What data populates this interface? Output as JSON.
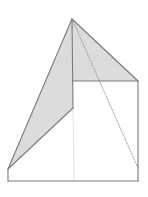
{
  "diagram": {
    "type": "geometric-solid",
    "colors": {
      "background": "#ffffff",
      "edge": "#7a7a7a",
      "shade": "#dcdcdc",
      "hidden": "#9a9a9a",
      "faint": "#e2e2e2"
    },
    "vertices": {
      "apex": [
        72,
        19
      ],
      "mid_top": [
        73,
        81
      ],
      "right_top": [
        138,
        81
      ],
      "mid_low": [
        73,
        108
      ],
      "left_low": [
        8,
        169
      ],
      "left_bottom": [
        8,
        181
      ],
      "right_bottom": [
        138,
        181
      ],
      "mid_bottom": [
        74,
        181
      ],
      "right_dash_end": [
        138,
        168
      ]
    },
    "shaded_faces": [
      {
        "name": "left-face",
        "points": [
          [
            72,
            19
          ],
          [
            73,
            108
          ],
          [
            8,
            169
          ]
        ]
      },
      {
        "name": "right-face",
        "points": [
          [
            72,
            19
          ],
          [
            138,
            81
          ],
          [
            73,
            81
          ]
        ]
      }
    ],
    "solid_edges": [
      [
        [
          72,
          19
        ],
        [
          8,
          169
        ]
      ],
      [
        [
          72,
          19
        ],
        [
          138,
          81
        ]
      ],
      [
        [
          72,
          19
        ],
        [
          73,
          108
        ]
      ],
      [
        [
          73,
          81
        ],
        [
          138,
          81
        ]
      ],
      [
        [
          73,
          108
        ],
        [
          8,
          169
        ]
      ],
      [
        [
          138,
          81
        ],
        [
          138,
          181
        ]
      ],
      [
        [
          8,
          169
        ],
        [
          8,
          181
        ]
      ],
      [
        [
          8,
          181
        ],
        [
          138,
          181
        ]
      ]
    ],
    "dashed_edges": [
      [
        [
          72,
          19
        ],
        [
          138,
          168
        ]
      ]
    ],
    "faint_edges": [
      [
        [
          73,
          108
        ],
        [
          74,
          181
        ]
      ]
    ]
  }
}
